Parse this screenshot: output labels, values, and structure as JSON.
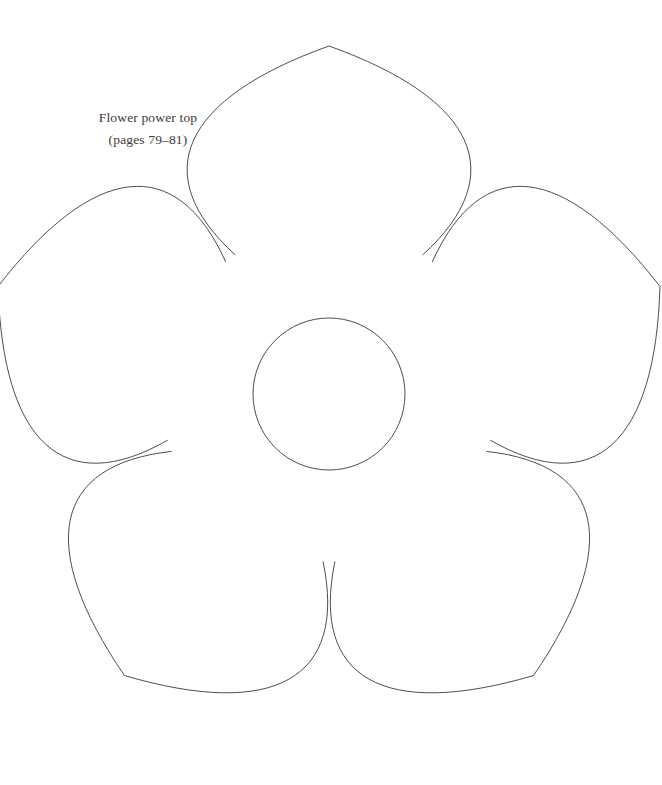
{
  "page": {
    "width": 662,
    "height": 785,
    "background_color": "#ffffff"
  },
  "caption": {
    "title": "Flower power top",
    "pages": "(pages 79–81)",
    "text_color": "#3c3a38"
  },
  "template": {
    "name": "flower-outline-template",
    "stroke_color": "#3a3a3a",
    "stroke_width": 0.9,
    "fill": "none",
    "petal_count": 5,
    "center": {
      "x": 329,
      "y": 394
    },
    "center_circle": {
      "cx": 329,
      "cy": 394,
      "r": 76
    },
    "petal_tip_radius": 348,
    "petal_notch_radius": 168,
    "petal_half_width_angle_deg": 34,
    "petal_rotations_deg": [
      0,
      72,
      144,
      216,
      288
    ]
  }
}
